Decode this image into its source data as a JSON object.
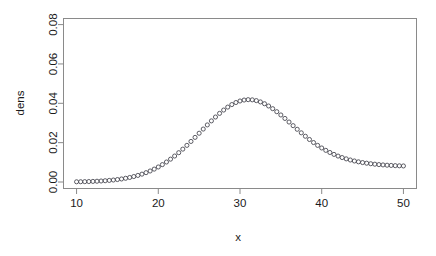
{
  "figure": {
    "background": "#ffffff",
    "point_color": "#4a4a52",
    "axis_color": "#8a8a8a",
    "text_color": "#1a1a1a"
  },
  "chart_data": {
    "type": "scatter",
    "title": "",
    "xlabel": "x",
    "ylabel": "dens",
    "xlim": [
      8.4,
      51.6
    ],
    "ylim": [
      -0.0033,
      0.0831
    ],
    "xticks": [
      10,
      20,
      30,
      40,
      50
    ],
    "xtick_labels": [
      "10",
      "20",
      "30",
      "40",
      "50"
    ],
    "yticks": [
      0.0,
      0.02,
      0.04,
      0.06,
      0.08
    ],
    "ytick_labels": [
      "0.00",
      "0.02",
      "0.04",
      "0.06",
      "0.08"
    ],
    "grid": false,
    "legend": null,
    "marker": "open-circle",
    "distribution": "normal density, mean 30, sd 5",
    "x": [
      10.0,
      10.5,
      11.0,
      11.5,
      12.0,
      12.5,
      13.0,
      13.5,
      14.0,
      14.5,
      15.0,
      15.5,
      16.0,
      16.5,
      17.0,
      17.5,
      18.0,
      18.5,
      19.0,
      19.5,
      20.0,
      20.5,
      21.0,
      21.5,
      22.0,
      22.5,
      23.0,
      23.5,
      24.0,
      24.5,
      25.0,
      25.5,
      26.0,
      26.5,
      27.0,
      27.5,
      28.0,
      28.5,
      29.0,
      29.5,
      30.0,
      30.5,
      31.0,
      31.5,
      32.0,
      32.5,
      33.0,
      33.5,
      34.0,
      34.5,
      35.0,
      35.5,
      36.0,
      36.5,
      37.0,
      37.5,
      38.0,
      38.5,
      39.0,
      39.5,
      40.0,
      40.5,
      41.0,
      41.5,
      42.0,
      42.5,
      43.0,
      43.5,
      44.0,
      44.5,
      45.0,
      45.5,
      46.0,
      46.5,
      47.0,
      47.5,
      48.0,
      48.5,
      49.0,
      49.5,
      50.0
    ],
    "y": [
      0.000108,
      0.000142,
      0.000186,
      0.000242,
      0.000312,
      0.0004,
      0.00051,
      0.000645,
      0.00081,
      0.001011,
      0.001253,
      0.001545,
      0.001892,
      0.002303,
      0.002785,
      0.003347,
      0.003997,
      0.004743,
      0.005593,
      0.006555,
      0.007634,
      0.008837,
      0.010165,
      0.01162,
      0.013199,
      0.014898,
      0.01671,
      0.018622,
      0.02062,
      0.022683,
      0.024788,
      0.026907,
      0.02901,
      0.031063,
      0.033031,
      0.034879,
      0.036572,
      0.038076,
      0.03936,
      0.040398,
      0.041169,
      0.041657,
      0.041853,
      0.041755,
      0.041369,
      0.040705,
      0.039784,
      0.038628,
      0.037268,
      0.035736,
      0.03407,
      0.032306,
      0.030483,
      0.028636,
      0.026798,
      0.024998,
      0.023262,
      0.02161,
      0.020058,
      0.018617,
      0.017294,
      0.016091,
      0.015007,
      0.014039,
      0.013181,
      0.012425,
      0.011763,
      0.011186,
      0.010686,
      0.010254,
      0.009882,
      0.009562,
      0.009288,
      0.009053,
      0.008853,
      0.008683,
      0.008539,
      0.008418,
      0.008316,
      0.008231,
      0.008161
    ]
  }
}
